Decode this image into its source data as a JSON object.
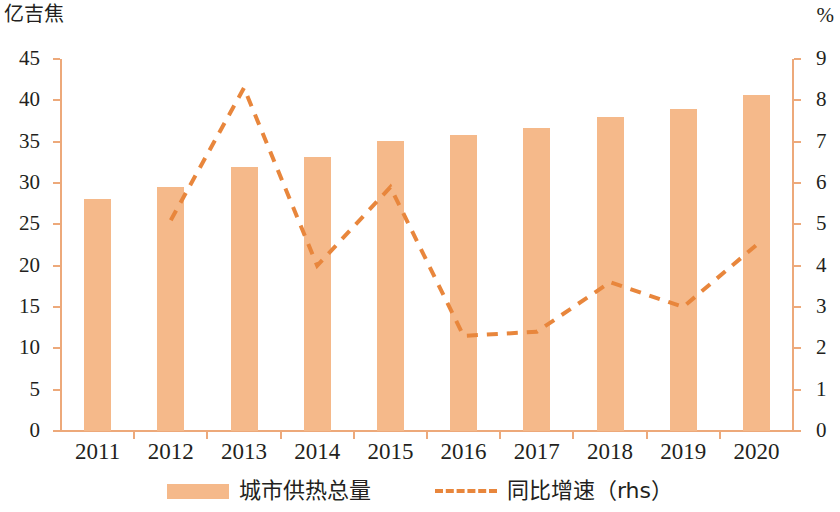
{
  "axes": {
    "left_unit": "亿吉焦",
    "right_unit": "%"
  },
  "legend": {
    "bar_label": "城市供热总量",
    "line_label": "同比增速（rhs）"
  },
  "colors": {
    "bar": "#f5b98a",
    "line": "#e8863c",
    "axis": "#eda97a",
    "text": "#231f20"
  },
  "chart_data": {
    "type": "bar",
    "title": "",
    "subtitle": "",
    "xlabel": "",
    "ylabel": "亿吉焦",
    "y2label": "%",
    "categories": [
      "2011",
      "2012",
      "2013",
      "2014",
      "2015",
      "2016",
      "2017",
      "2018",
      "2019",
      "2020"
    ],
    "ylim": [
      0,
      45
    ],
    "y2lim": [
      0,
      9
    ],
    "yticks": [
      0,
      5,
      10,
      15,
      20,
      25,
      30,
      35,
      40,
      45
    ],
    "y2ticks": [
      0,
      1,
      2,
      3,
      4,
      5,
      6,
      7,
      8,
      9
    ],
    "grid": false,
    "legend_position": "bottom",
    "series": [
      {
        "name": "城市供热总量",
        "type": "bar",
        "axis": "left",
        "unit": "亿吉焦",
        "color": "#f5b98a",
        "values": [
          28.1,
          29.5,
          31.9,
          33.1,
          35.1,
          35.8,
          36.6,
          38.0,
          39.0,
          40.6
        ]
      },
      {
        "name": "同比增速（rhs）",
        "type": "line",
        "style": "dashed",
        "axis": "right",
        "unit": "%",
        "color": "#e8863c",
        "values": [
          null,
          5.1,
          8.3,
          4.0,
          5.9,
          2.3,
          2.4,
          3.6,
          3.0,
          4.5
        ]
      }
    ]
  }
}
